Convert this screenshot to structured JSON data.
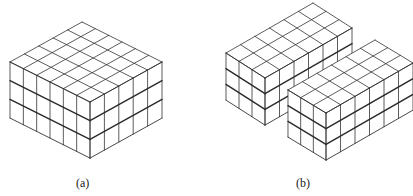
{
  "figure": {
    "line_color": "#333333",
    "thick_line_color": "#2a2a2a",
    "fill_color": "#ffffff",
    "panels": [
      {
        "id": "a",
        "label": "(a)",
        "label_pos": [
          76,
          176
        ],
        "blocks": [
          {
            "front": [
              90,
              102
            ],
            "left_cols": 6,
            "right_cols": 5,
            "layers": 3,
            "ux": [
              -13.33,
              -6.67
            ],
            "vx": [
              14.4,
              -8.0
            ],
            "h": 18.7
          }
        ]
      },
      {
        "id": "b",
        "label": "(b)",
        "label_pos": [
          296,
          176
        ],
        "blocks": [
          {
            "front": [
              265,
              78
            ],
            "left_cols": 3,
            "right_cols": 6,
            "layers": 3,
            "ux": [
              -13.0,
              -8.33
            ],
            "vx": [
              14.5,
              -8.33
            ],
            "h": 15.7
          },
          {
            "front": [
              326,
              113
            ],
            "left_cols": 3,
            "right_cols": 6,
            "layers": 3,
            "ux": [
              -12.67,
              -7.67
            ],
            "vx": [
              14.5,
              -8.33
            ],
            "h": 15.7
          }
        ]
      }
    ]
  }
}
